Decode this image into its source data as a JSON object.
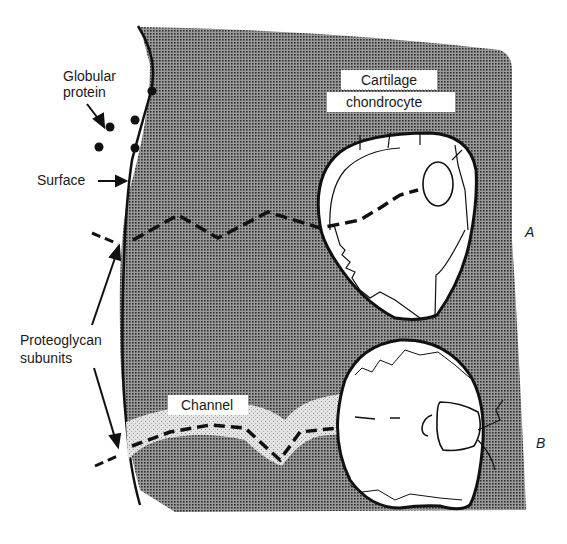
{
  "figure": {
    "labels": {
      "globular_protein_line1": "Globular",
      "globular_protein_line2": "protein",
      "surface": "Surface",
      "cartilage": "Cartilage",
      "chondrocyte": "chondrocyte",
      "proteoglycan_line1": "Proteoglycan",
      "proteoglycan_line2": "subunits",
      "channel": "Channel",
      "panel_a": "A",
      "panel_b": "B"
    },
    "colors": {
      "matrix_fill": "#6e6e6e",
      "cell_fill": "#ffffff",
      "channel_fill": "#d9d9d9",
      "ink": "#111111"
    }
  }
}
